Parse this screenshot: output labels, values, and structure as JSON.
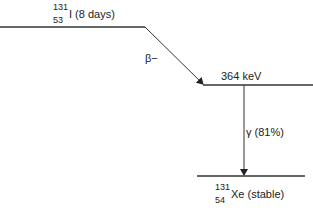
{
  "diagram": {
    "type": "nuclear-decay-scheme",
    "parent": {
      "mass_number": "131",
      "atomic_number": "53",
      "symbol": "I",
      "label_suffix": " (8 days)"
    },
    "beta": {
      "label": "β−"
    },
    "excited_level": {
      "label": "364 keV"
    },
    "gamma": {
      "label": "γ (81%)"
    },
    "daughter": {
      "mass_number": "131",
      "atomic_number": "54",
      "symbol": "Xe",
      "label_suffix": " (stable)"
    },
    "colors": {
      "line": "#333333",
      "text": "#222222"
    }
  }
}
